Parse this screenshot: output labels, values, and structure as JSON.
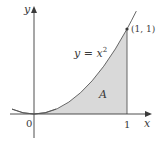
{
  "diagram": {
    "axes": {
      "x_label": "x",
      "y_label": "y",
      "origin_label": "0",
      "x_tick_label": "1"
    },
    "curve": {
      "equation_lhs": "y = x",
      "equation_exponent": "2",
      "color": "#555555"
    },
    "point": {
      "label": "(1, 1)",
      "x": 1,
      "y": 1
    },
    "region": {
      "label": "A",
      "fill": "#d9d9d9",
      "x_from": 0,
      "x_to": 1
    },
    "colors": {
      "axis": "#3a3a3a",
      "background": "#ffffff"
    }
  }
}
